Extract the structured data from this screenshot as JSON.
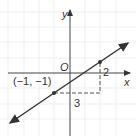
{
  "diagram": {
    "axes": {
      "x_label": "x",
      "y_label": "y",
      "origin_label": "O"
    },
    "points": [
      {
        "label": "(−1, −1)",
        "x": -1,
        "y": -1
      },
      {
        "label": "",
        "x": 2,
        "y": 1
      }
    ],
    "slope_triangle": {
      "run_label": "3",
      "rise_label": "2"
    },
    "colors": {
      "line": "#333333",
      "grid": "#eeeeee",
      "text": "#333333"
    }
  }
}
